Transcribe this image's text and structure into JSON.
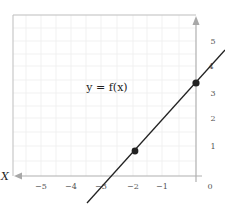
{
  "diagram": {
    "function_label": "y = f(x)",
    "x_axis_name": "X",
    "x_ticks": [
      "−5",
      "−4",
      "−3",
      "−2",
      "−1",
      "0"
    ],
    "y_ticks": [
      "5",
      "4",
      "3",
      "2",
      "1"
    ],
    "points": [
      {
        "label": "point-a",
        "x": -2,
        "y": 1
      },
      {
        "label": "point-b",
        "x": 0,
        "y": 3.5
      }
    ],
    "colors": {
      "line": "#222222",
      "axis": "#b0b0b0",
      "grid": "#eeeeee",
      "background": "#ffffff"
    }
  }
}
